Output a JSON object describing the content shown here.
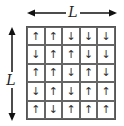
{
  "labels": {
    "horizontal": "L",
    "vertical": "L"
  },
  "grid": {
    "rows": 5,
    "cols": 5,
    "cells": [
      [
        "up",
        "up",
        "down",
        "down",
        "down"
      ],
      [
        "down",
        "up",
        "up",
        "down",
        "down"
      ],
      [
        "up",
        "up",
        "down",
        "up",
        "down"
      ],
      [
        "down",
        "up",
        "down",
        "up",
        "up"
      ],
      [
        "up",
        "down",
        "up",
        "up",
        "up"
      ]
    ]
  },
  "glyphs": {
    "up": "↑",
    "down": "↓"
  }
}
